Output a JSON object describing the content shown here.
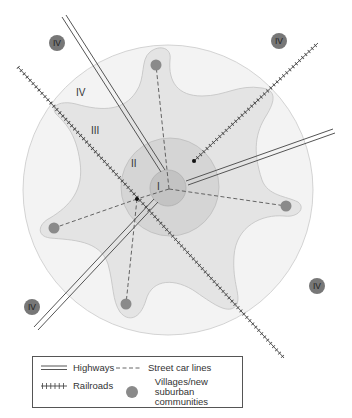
{
  "zones": {
    "I": "I",
    "II": "II",
    "III": "III",
    "IV": "IV"
  },
  "badges": [
    {
      "label": "IV",
      "x": 57,
      "y": 43
    },
    {
      "label": "IV",
      "x": 279,
      "y": 41
    },
    {
      "label": "IV",
      "x": 316,
      "y": 286
    },
    {
      "label": "IV",
      "x": 33,
      "y": 307
    }
  ],
  "villages": [
    {
      "x": 156,
      "y": 65
    },
    {
      "x": 286,
      "y": 206
    },
    {
      "x": 54,
      "y": 228
    },
    {
      "x": 126,
      "y": 304
    }
  ],
  "colors": {
    "outer_ring": "#f2f2f2",
    "zone_iii": "#e3e3e3",
    "zone_ii": "#d4d4d4",
    "zone_i": "#c4c4c4",
    "village": "#8a8a8a",
    "badge": "#777777",
    "line": "#444444"
  },
  "legend": {
    "highways": "Highways",
    "railroads": "Railroads",
    "streetcar": "Street car lines",
    "villages_line1": "Villages/new",
    "villages_line2": "suburban communities"
  }
}
